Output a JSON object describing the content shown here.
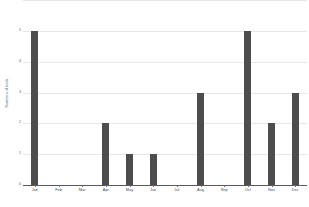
{
  "chart_data": {
    "type": "bar",
    "title": "",
    "xlabel": "",
    "ylabel": "Numbers of birds",
    "categories": [
      "Jan",
      "Feb",
      "Mar",
      "Apr",
      "May",
      "Jun",
      "Jul",
      "Aug",
      "Sep",
      "Oct",
      "Nov",
      "Dec"
    ],
    "values": [
      5,
      0,
      0,
      2,
      1,
      1,
      0,
      3,
      0,
      5,
      2,
      3
    ],
    "ylim": [
      0,
      6
    ],
    "ytick_labels": [
      "0",
      "1",
      "2",
      "3",
      "4",
      "5",
      "6"
    ],
    "ytick_values": [
      0,
      1,
      2,
      3,
      4,
      5,
      6
    ],
    "grid": true,
    "legend": false,
    "bar_color": "#4d4d4d",
    "gridline_color": "#e8e8e8",
    "axis_color": "#5a5a5a",
    "background_color": "#ffffff"
  }
}
